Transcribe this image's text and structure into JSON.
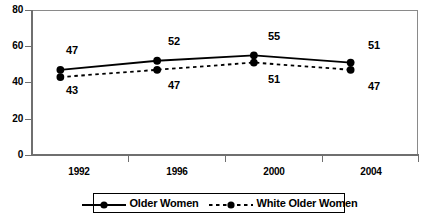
{
  "chart_data": {
    "type": "line",
    "title": "",
    "xlabel": "",
    "ylabel": "",
    "categories": [
      "1992",
      "1996",
      "2000",
      "2004"
    ],
    "ylim": [
      0,
      80
    ],
    "yticks": [
      0,
      20,
      40,
      60,
      80
    ],
    "grid": false,
    "legend_position": "bottom",
    "series": [
      {
        "name": "Older Women",
        "style": "solid",
        "marker": "circle",
        "color": "#000000",
        "values": [
          47,
          52,
          55,
          51
        ],
        "labels": [
          "47",
          "52",
          "55",
          "51"
        ]
      },
      {
        "name": "White Older Women",
        "style": "dashed",
        "marker": "circle",
        "color": "#000000",
        "values": [
          43,
          47,
          51,
          47
        ],
        "labels": [
          "43",
          "47",
          "51",
          "47"
        ]
      }
    ]
  },
  "axes": {
    "y_tick_labels": [
      "80",
      "60",
      "40",
      "20",
      "0"
    ],
    "x_tick_labels": [
      "1992",
      "1996",
      "2000",
      "2004"
    ]
  },
  "legend": {
    "entries": [
      {
        "label": "Older Women",
        "icon": "solid-line-circle-marker"
      },
      {
        "label": "White Older Women",
        "icon": "dashed-line-circle-marker"
      }
    ]
  }
}
